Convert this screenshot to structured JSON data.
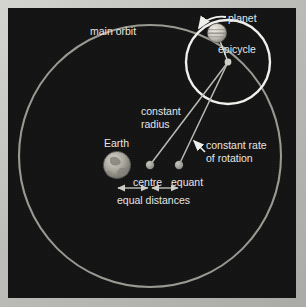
{
  "diagram": {
    "background_color": "#121212",
    "frame_color": "#c2c2bf",
    "orbit_color": "#9a9a93",
    "epicycle_color": "#f2f2ee",
    "line_color": "#b8b8b2",
    "text_color": "#e8e8e6",
    "labels": {
      "main_orbit": "main orbit",
      "planet": "planet",
      "epicycle": "epicycle",
      "constant_radius_line1": "constant",
      "constant_radius_line2": "radius",
      "constant_rate_line1": "constant rate",
      "constant_rate_line2": "of rotation",
      "earth": "Earth",
      "centre": "centre",
      "equant": "equant",
      "equal_distances": "equal distances"
    },
    "icons": {
      "planet": "banded-planet-sphere-icon",
      "earth": "earth-globe-icon",
      "rotation_arrow": "rotation-direction-arrow-icon",
      "pointer_arrow": "pointer-arrow-icon",
      "measure_arrow_left": "double-headed-arrow-icon",
      "measure_arrow_right": "double-headed-arrow-icon"
    },
    "geometry": {
      "main_orbit": {
        "cx": 142,
        "cy": 148,
        "rx": 131,
        "ry": 131
      },
      "epicycle": {
        "cx": 220,
        "cy": 54,
        "r": 42
      },
      "planet": {
        "cx": 209,
        "cy": 25,
        "r": 10
      },
      "earth": {
        "cx": 109,
        "cy": 157,
        "r": 14
      },
      "centre_dot": {
        "cx": 142,
        "cy": 157,
        "r": 4
      },
      "equant_dot": {
        "cx": 171,
        "cy": 157,
        "r": 4
      },
      "equal_distance_spans": [
        {
          "x1": 109,
          "x2": 142,
          "y": 180
        },
        {
          "x1": 142,
          "x2": 171,
          "y": 180
        }
      ]
    }
  }
}
